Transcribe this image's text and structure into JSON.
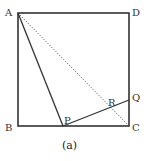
{
  "figure": {
    "caption": "(a)",
    "colors": {
      "stroke": "#333333",
      "dotted": "#444444",
      "background": "#ffffff"
    },
    "points": {
      "A": {
        "label": "A",
        "x": 18,
        "y": 13
      },
      "B": {
        "label": "B",
        "x": 18,
        "y": 126
      },
      "C": {
        "label": "C",
        "x": 129,
        "y": 126
      },
      "D": {
        "label": "D",
        "x": 129,
        "y": 13
      },
      "P": {
        "label": "P",
        "x": 63,
        "y": 126
      },
      "Q": {
        "label": "Q",
        "x": 129,
        "y": 100
      },
      "R": {
        "label": "R",
        "x": 111,
        "y": 107
      }
    },
    "segments": [
      {
        "from": "A",
        "to": "D",
        "style": "solid"
      },
      {
        "from": "D",
        "to": "C",
        "style": "solid"
      },
      {
        "from": "C",
        "to": "B",
        "style": "solid"
      },
      {
        "from": "B",
        "to": "A",
        "style": "solid"
      },
      {
        "from": "A",
        "to": "P",
        "style": "solid"
      },
      {
        "from": "P",
        "to": "Q",
        "style": "solid"
      },
      {
        "from": "A",
        "to": "C",
        "style": "dotted"
      }
    ]
  }
}
